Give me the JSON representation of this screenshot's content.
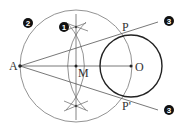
{
  "diagram": {
    "points": {
      "A": {
        "label": "A",
        "x": 20,
        "y": 66
      },
      "M": {
        "label": "M",
        "x": 76,
        "y": 66
      },
      "O": {
        "label": "O",
        "x": 131,
        "y": 66
      },
      "P": {
        "label": "P",
        "x": 122,
        "y": 36
      },
      "P_prime": {
        "label": "P'",
        "x": 122,
        "y": 96
      }
    },
    "circles": {
      "given_circle": {
        "cx": 131,
        "cy": 66,
        "r": 31,
        "color": "#222222"
      },
      "construction_circle": {
        "cx": 76,
        "cy": 66,
        "r": 56,
        "color": "#777777"
      }
    },
    "steps": {
      "step1": {
        "label": "1",
        "description": "perpendicular bisector of AO"
      },
      "step2": {
        "label": "2",
        "description": "circle centered at M through A and O"
      },
      "step3a": {
        "label": "3",
        "description": "tangent line AP"
      },
      "step3b": {
        "label": "3",
        "description": "tangent line AP'"
      }
    },
    "colors": {
      "line": "#666666",
      "bold_circle": "#222222",
      "badge": "#111111"
    }
  }
}
